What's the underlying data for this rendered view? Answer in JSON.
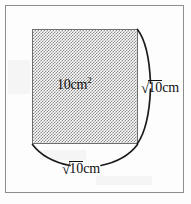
{
  "figure": {
    "shape": {
      "name": "shaded-square",
      "fill_style": "dotted-halftone",
      "fill_color": "#8a8a8a",
      "outline_color": "#6f6f6f"
    },
    "area_label": {
      "value": "10cm",
      "exponent": "2",
      "full_text": "10cm²"
    },
    "right_side_label": {
      "surd": "√",
      "radicand": "10",
      "unit": "cm",
      "full_text": "√10cm"
    },
    "bottom_side_label": {
      "surd": "√",
      "radicand": "10",
      "unit": "cm",
      "full_text": "√10cm"
    },
    "braces": [
      {
        "name": "right-brace",
        "orientation": "vertical"
      },
      {
        "name": "bottom-brace",
        "orientation": "horizontal"
      }
    ],
    "border_color": "#8d8d8d",
    "ink_color": "#101010",
    "background_color": "#fdfdfd"
  }
}
